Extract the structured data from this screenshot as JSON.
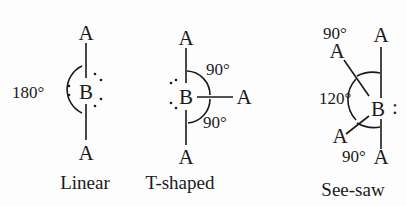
{
  "diagrams": [
    {
      "name": "Linear",
      "caption": "Linear",
      "central_atom": "B",
      "atoms": {
        "top": "A",
        "bottom": "A"
      },
      "angles": {
        "bond": "180°"
      },
      "lone_pairs": 3
    },
    {
      "name": "T-shaped",
      "caption": "T-shaped",
      "central_atom": "B",
      "atoms": {
        "top": "A",
        "right": "A",
        "bottom": "A"
      },
      "angles": {
        "upper": "90°",
        "lower": "90°"
      },
      "lone_pairs": 2
    },
    {
      "name": "See-saw",
      "caption": "See-saw",
      "central_atom": "B",
      "atoms": {
        "top": "A",
        "upper_left": "A",
        "lower_left": "A",
        "bottom": "A"
      },
      "angles": {
        "top": "90°",
        "equatorial": "120°",
        "bottom": "90°"
      },
      "lone_pair_symbol": ":",
      "lone_pairs": 1
    }
  ],
  "colors": {
    "ink": "#1a1a1a",
    "background": "#fdfdfd"
  }
}
